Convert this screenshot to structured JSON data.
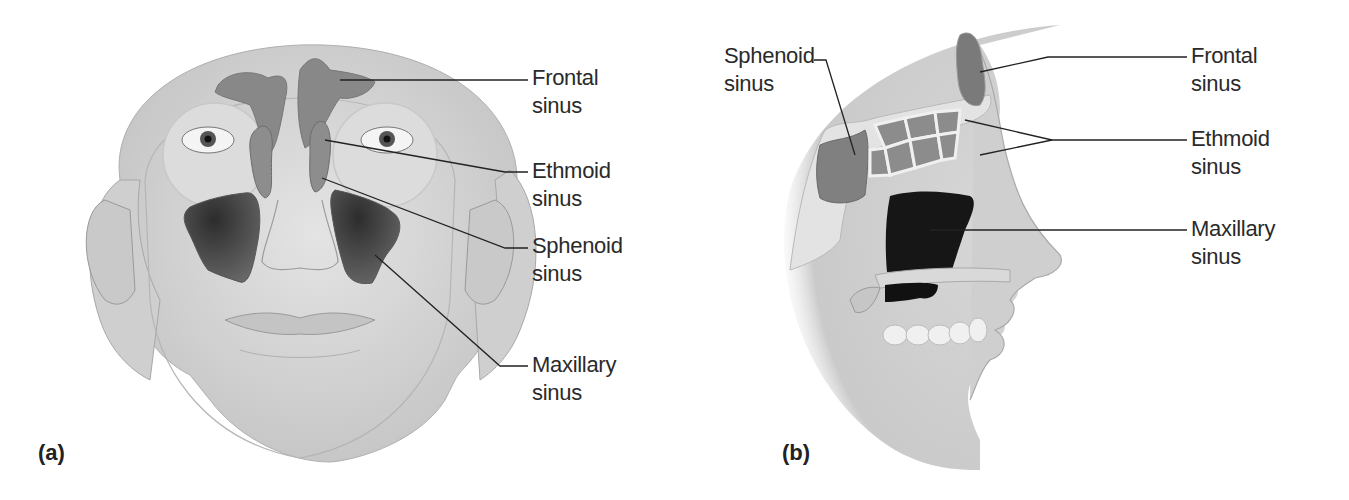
{
  "figure": {
    "panel_a": {
      "tag": "(a)",
      "view": "frontal",
      "labels": [
        {
          "line1": "Frontal",
          "line2": "sinus"
        },
        {
          "line1": "Ethmoid",
          "line2": "sinus"
        },
        {
          "line1": "Sphenoid",
          "line2": "sinus"
        },
        {
          "line1": "Maxillary",
          "line2": "sinus"
        }
      ]
    },
    "panel_b": {
      "tag": "(b)",
      "view": "sagittal",
      "labels": [
        {
          "line1": "Sphenoid",
          "line2": "sinus"
        },
        {
          "line1": "Frontal",
          "line2": "sinus"
        },
        {
          "line1": "Ethmoid",
          "line2": "sinus"
        },
        {
          "line1": "Maxillary",
          "line2": "sinus"
        }
      ]
    },
    "colors": {
      "skin": "#d4d4d4",
      "sinus_mid": "#8a8a8a",
      "sinus_dark": "#3a3a3a",
      "bone": "#e6e6e6",
      "leader": "#222222"
    }
  }
}
